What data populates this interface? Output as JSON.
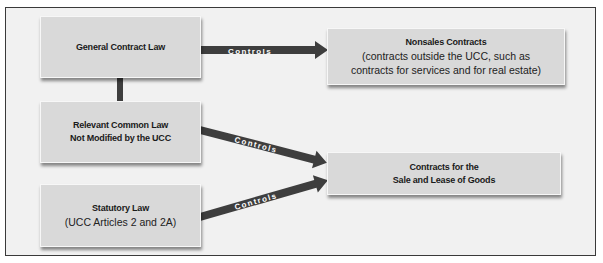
{
  "diagram": {
    "nodes": {
      "general_contract_law": {
        "title": "General Contract Law"
      },
      "relevant_common_law": {
        "title_line1": "Relevant Common Law",
        "title_line2": "Not Modified by the UCC"
      },
      "statutory_law": {
        "title": "Statutory Law",
        "subtitle": "(UCC Articles 2 and 2A)"
      },
      "nonsales_contracts": {
        "title": "Nonsales Contracts",
        "subtitle_line1": "(contracts outside the UCC, such as",
        "subtitle_line2": "contracts for services and for real estate)"
      },
      "sale_lease_goods": {
        "title_line1": "Contracts for the",
        "title_line2": "Sale and Lease of Goods"
      }
    },
    "edges": [
      {
        "from": "general_contract_law",
        "to": "nonsales_contracts",
        "label": "Controls"
      },
      {
        "from": "relevant_common_law",
        "to": "sale_lease_goods",
        "label": "Controls"
      },
      {
        "from": "statutory_law",
        "to": "sale_lease_goods",
        "label": "Controls"
      },
      {
        "from": "general_contract_law",
        "to": "relevant_common_law",
        "label": ""
      }
    ],
    "colors": {
      "box_fill": "#d9d9d9",
      "arrow_fill": "#3e3e3e",
      "arrow_text": "#ffffff",
      "frame_border": "#3a3a3a",
      "frame_fill": "#f1f1f1"
    }
  }
}
